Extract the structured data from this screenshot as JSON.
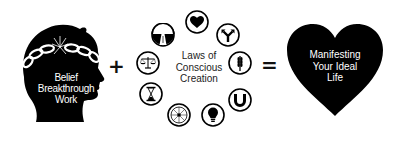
{
  "diagram": {
    "type": "equation",
    "left_term": {
      "label_lines": [
        "Belief",
        "Breakthrough",
        "Work"
      ],
      "image": "head-silhouette-with-broken-chain"
    },
    "operator_1": "+",
    "middle_term": {
      "label_lines": [
        "Laws of",
        "Conscious",
        "Creation"
      ],
      "icons": [
        {
          "name": "road-icon",
          "meaning": "road / path"
        },
        {
          "name": "heart-icon",
          "meaning": "heart"
        },
        {
          "name": "fork-arrow-icon",
          "meaning": "forked arrow / choice"
        },
        {
          "name": "wheat-icon",
          "meaning": "wheat / harvest"
        },
        {
          "name": "magnet-icon",
          "meaning": "magnet / attraction"
        },
        {
          "name": "lightbulb-icon",
          "meaning": "lightbulb / idea"
        },
        {
          "name": "compass-star-icon",
          "meaning": "starburst / compass"
        },
        {
          "name": "hourglass-icon",
          "meaning": "hourglass / time"
        },
        {
          "name": "scales-icon",
          "meaning": "scales / balance"
        }
      ]
    },
    "operator_2": "=",
    "result": {
      "label_lines": [
        "Manifesting",
        "Your Ideal",
        "Life"
      ],
      "shape": "heart"
    }
  },
  "colors": {
    "ink": "#000000",
    "background": "#ffffff",
    "text_on_dark": "#ffffff"
  }
}
